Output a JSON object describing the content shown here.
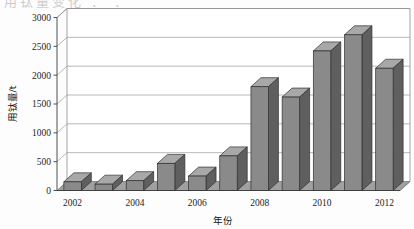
{
  "scan": {
    "top_remnant_text": "用钛量变化 ：  ："
  },
  "chart_data": {
    "type": "bar",
    "title": "",
    "xlabel": "年份",
    "ylabel": "用钛量/t",
    "categories": [
      "2002",
      "2003",
      "2004",
      "2005",
      "2006",
      "2007",
      "2008",
      "2009",
      "2010",
      "2011",
      "2012"
    ],
    "tick_labels_shown": [
      "2002",
      "2004",
      "2006",
      "2008",
      "2010",
      "2012"
    ],
    "values": [
      150,
      110,
      170,
      470,
      250,
      600,
      1800,
      1620,
      2420,
      2700,
      2120
    ],
    "ylim": [
      0,
      3000
    ],
    "yticks": [
      0,
      500,
      1000,
      1500,
      2000,
      2500,
      3000
    ],
    "ytick_labels": [
      "0",
      "500",
      "1000",
      "1500",
      "2000",
      "2500",
      "3000"
    ],
    "grid": true,
    "legend": "none",
    "style": "3d-column",
    "colors": {
      "bar_front": "#8a8a8a",
      "bar_side": "#5f5f5f",
      "bar_top": "#a8a8a8",
      "floor": "#a0a0a0",
      "grid": "#9a9a9a",
      "axis": "#3c3c3c",
      "background": "#fdfdfd"
    }
  }
}
